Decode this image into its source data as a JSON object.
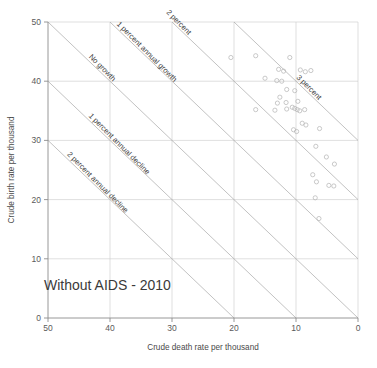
{
  "chart_data": {
    "type": "scatter",
    "title": "Without AIDS - 2010",
    "xlabel": "Crude death rate per thousand",
    "ylabel": "Crude birth rate per thousand",
    "xlim": [
      50,
      0
    ],
    "ylim": [
      0,
      50
    ],
    "x_axis_reversed": true,
    "grid": true,
    "legend_position": "none",
    "xticks": [
      50,
      40,
      30,
      20,
      10,
      0
    ],
    "yticks": [
      0,
      10,
      20,
      30,
      40,
      50
    ],
    "xtick_labels": [
      "50",
      "40",
      "30",
      "20",
      "10",
      "0"
    ],
    "ytick_labels": [
      "0",
      "10",
      "20",
      "30",
      "40",
      "50"
    ],
    "reference_lines": [
      {
        "label": "No growth",
        "growth_percent": 0,
        "intercept": 0
      },
      {
        "label": "1 percent annual growth",
        "growth_percent": 1,
        "intercept": 10
      },
      {
        "label": "2 percent",
        "growth_percent": 2,
        "intercept": 20
      },
      {
        "label": "3 percent",
        "growth_percent": 3,
        "intercept": 30
      },
      {
        "label": "1 percent annual decline",
        "growth_percent": -1,
        "intercept": -10
      },
      {
        "label": "2 percent annual decline",
        "growth_percent": -2,
        "intercept": -20
      }
    ],
    "point_marker": "open-circle",
    "point_color": "#b7b7b7",
    "series": [
      {
        "name": "Countries",
        "points": [
          {
            "x": 20.5,
            "y": 44.0
          },
          {
            "x": 16.5,
            "y": 44.3
          },
          {
            "x": 11.0,
            "y": 44.0
          },
          {
            "x": 15.0,
            "y": 40.5
          },
          {
            "x": 12.8,
            "y": 42.0
          },
          {
            "x": 12.0,
            "y": 41.7
          },
          {
            "x": 9.3,
            "y": 41.9
          },
          {
            "x": 8.5,
            "y": 41.6
          },
          {
            "x": 7.6,
            "y": 41.8
          },
          {
            "x": 13.1,
            "y": 40.1
          },
          {
            "x": 12.3,
            "y": 40.0
          },
          {
            "x": 11.5,
            "y": 38.6
          },
          {
            "x": 10.2,
            "y": 38.4
          },
          {
            "x": 12.6,
            "y": 37.3
          },
          {
            "x": 11.6,
            "y": 36.4
          },
          {
            "x": 13.0,
            "y": 36.3
          },
          {
            "x": 9.7,
            "y": 36.6
          },
          {
            "x": 13.4,
            "y": 35.1
          },
          {
            "x": 16.5,
            "y": 35.2
          },
          {
            "x": 11.5,
            "y": 35.3
          },
          {
            "x": 10.6,
            "y": 35.6
          },
          {
            "x": 10.2,
            "y": 35.4
          },
          {
            "x": 9.8,
            "y": 35.2
          },
          {
            "x": 9.4,
            "y": 35.0
          },
          {
            "x": 8.6,
            "y": 35.2
          },
          {
            "x": 9.0,
            "y": 32.9
          },
          {
            "x": 8.4,
            "y": 32.6
          },
          {
            "x": 10.4,
            "y": 31.8
          },
          {
            "x": 9.9,
            "y": 31.5
          },
          {
            "x": 6.2,
            "y": 32.0
          },
          {
            "x": 6.8,
            "y": 29.0
          },
          {
            "x": 5.1,
            "y": 27.2
          },
          {
            "x": 3.8,
            "y": 26.0
          },
          {
            "x": 7.3,
            "y": 24.2
          },
          {
            "x": 6.7,
            "y": 23.0
          },
          {
            "x": 4.7,
            "y": 22.4
          },
          {
            "x": 3.9,
            "y": 22.3
          },
          {
            "x": 6.9,
            "y": 20.3
          },
          {
            "x": 6.3,
            "y": 16.8
          }
        ]
      }
    ]
  },
  "axes": {
    "x_title": "Crude death rate per thousand",
    "y_title": "Crude birth rate per thousand"
  },
  "annotation": {
    "scenario_title": "Without AIDS - 2010"
  }
}
